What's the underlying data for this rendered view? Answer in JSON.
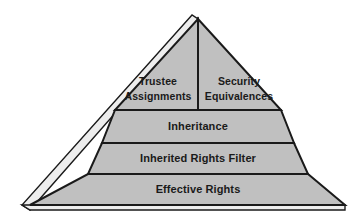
{
  "diagram": {
    "type": "pyramid",
    "title": "",
    "orientation": "apex-up",
    "tier_count": 4,
    "colors": {
      "face_fill": "#c0c0c0",
      "bevel_fill": "#ededed",
      "outline": "#1a1a1a",
      "text": "#1a1a1a",
      "background": "#ffffff"
    },
    "tiers": [
      {
        "level": 1,
        "position": "top",
        "split": true,
        "cells": [
          {
            "label_line1": "Trustee",
            "label_line2": "Assignments"
          },
          {
            "label_line1": "Security",
            "label_line2": "Equivalences"
          }
        ]
      },
      {
        "level": 2,
        "position": "upper-middle",
        "split": false,
        "cells": [
          {
            "label_line1": "Inheritance",
            "label_line2": ""
          }
        ]
      },
      {
        "level": 3,
        "position": "lower-middle",
        "split": false,
        "cells": [
          {
            "label_line1": "Inherited Rights Filter",
            "label_line2": ""
          }
        ]
      },
      {
        "level": 4,
        "position": "base",
        "split": false,
        "cells": [
          {
            "label_line1": "Effective Rights",
            "label_line2": ""
          }
        ]
      }
    ]
  }
}
